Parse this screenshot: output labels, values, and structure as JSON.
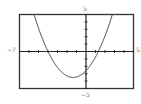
{
  "chart_data": {
    "type": "line",
    "title": "",
    "xlabel": "",
    "ylabel": "",
    "xlim": [
      -7,
      5
    ],
    "ylim": [
      -5,
      5
    ],
    "x_tick_step": 1,
    "y_tick_step": 1,
    "grid": false,
    "legend": null,
    "tick_labels": {
      "xmin": "−7",
      "xmax": "5",
      "ymin": "−5",
      "ymax": "5"
    },
    "series": [
      {
        "name": "parabola",
        "equation": "y = 0.5x^2 + 1.35x - 2.6",
        "coefficients": {
          "a": 0.5,
          "b": 1.35,
          "c": -2.6
        },
        "x_intercepts": [
          -4.0,
          1.3
        ],
        "vertex": [
          -1.35,
          -3.5
        ],
        "x": [
          -5.5,
          -5,
          -4,
          -3,
          -2,
          -1.35,
          -1,
          0,
          1,
          2,
          2.8
        ],
        "values": [
          5.1,
          3.1,
          -0.0,
          -2.1,
          -3.3,
          -3.5,
          -3.5,
          -2.6,
          -0.8,
          2.1,
          5.1
        ]
      }
    ],
    "colors": {
      "curve": "#333333",
      "axes": "#222222",
      "frame": "#333333"
    }
  }
}
